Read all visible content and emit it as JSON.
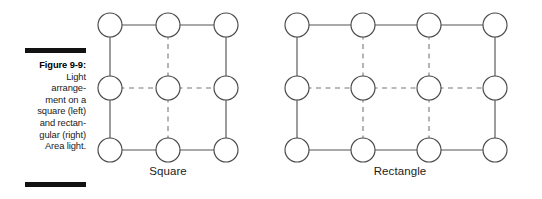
{
  "figure": {
    "caption_label": "Figure 9-9:",
    "caption_body": "Light arrange-ment on a square (left) and rectan-gular (right) Area light.",
    "caption_lines": [
      "Light",
      "arrange-",
      "ment on a",
      "square (left)",
      "and rectan-",
      "gular (right)",
      "Area light."
    ],
    "rule_color": "#121212"
  },
  "diagrams": [
    {
      "id": "square",
      "label": "Square",
      "columns": 3,
      "rows": 3,
      "node_count": 9,
      "node_shape": "circle",
      "node_radius": 12,
      "perimeter_line_style": "solid",
      "interior_line_style": "dashed",
      "line_color": "#555555",
      "node_fill": "#ffffff",
      "node_stroke": "#4a4a4a"
    },
    {
      "id": "rectangle",
      "label": "Rectangle",
      "columns": 4,
      "rows": 3,
      "node_count": 12,
      "node_shape": "circle",
      "node_radius": 12,
      "perimeter_line_style": "solid",
      "interior_line_style": "dashed",
      "line_color": "#555555",
      "node_fill": "#ffffff",
      "node_stroke": "#4a4a4a"
    }
  ]
}
